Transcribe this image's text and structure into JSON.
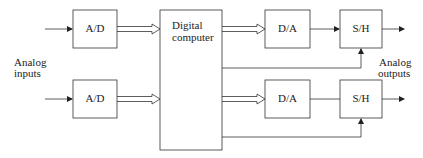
{
  "diagram": {
    "blocks": {
      "ad_top": "A/D",
      "ad_bottom": "A/D",
      "computer_line1": "Digital",
      "computer_line2": "computer",
      "da_top": "D/A",
      "da_bottom": "D/A",
      "sh_top": "S/H",
      "sh_bottom": "S/H"
    },
    "labels": {
      "inputs_line1": "Analog",
      "inputs_line2": "inputs",
      "outputs_line1": "Analog",
      "outputs_line2": "outputs"
    },
    "stroke_color": "#222222"
  }
}
